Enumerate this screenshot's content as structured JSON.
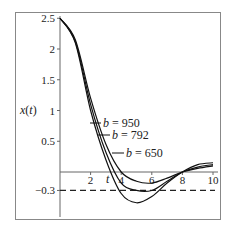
{
  "chart_data": {
    "type": "line",
    "title": "",
    "xlabel": "t",
    "ylabel": "x(t)",
    "xlim": [
      0,
      10
    ],
    "ylim": [
      -0.65,
      2.55
    ],
    "xticks": [
      2,
      4,
      6,
      8,
      10
    ],
    "yticks": [
      2.5,
      2,
      1.5,
      1,
      0.5,
      -0.3
    ],
    "ytick_labels": [
      "2.5",
      "2",
      "1.5",
      "1",
      "0.5",
      "−0.3"
    ],
    "reference_line": {
      "y": -0.3,
      "style": "dashed"
    },
    "grid": false,
    "series": [
      {
        "name": "b = 950",
        "label_text": "b = 950",
        "x": [
          0,
          1,
          2,
          3,
          4,
          5,
          6,
          7,
          8,
          9,
          10
        ],
        "y": [
          2.5,
          2.1,
          1.0,
          0.2,
          -0.35,
          -0.5,
          -0.4,
          -0.18,
          0.0,
          0.12,
          0.15
        ]
      },
      {
        "name": "b = 792",
        "label_text": "b = 792",
        "x": [
          0,
          1,
          2,
          3,
          4,
          5,
          6,
          7,
          8,
          9,
          10
        ],
        "y": [
          2.5,
          2.12,
          1.1,
          0.32,
          -0.18,
          -0.3,
          -0.3,
          -0.15,
          0.0,
          0.08,
          0.12
        ]
      },
      {
        "name": "b = 650",
        "label_text": "b = 650",
        "x": [
          0,
          1,
          2,
          3,
          4,
          5,
          6,
          7,
          8,
          9,
          10
        ],
        "y": [
          2.5,
          2.15,
          1.2,
          0.45,
          0.0,
          -0.15,
          -0.18,
          -0.1,
          0.0,
          0.06,
          0.1
        ]
      }
    ]
  }
}
